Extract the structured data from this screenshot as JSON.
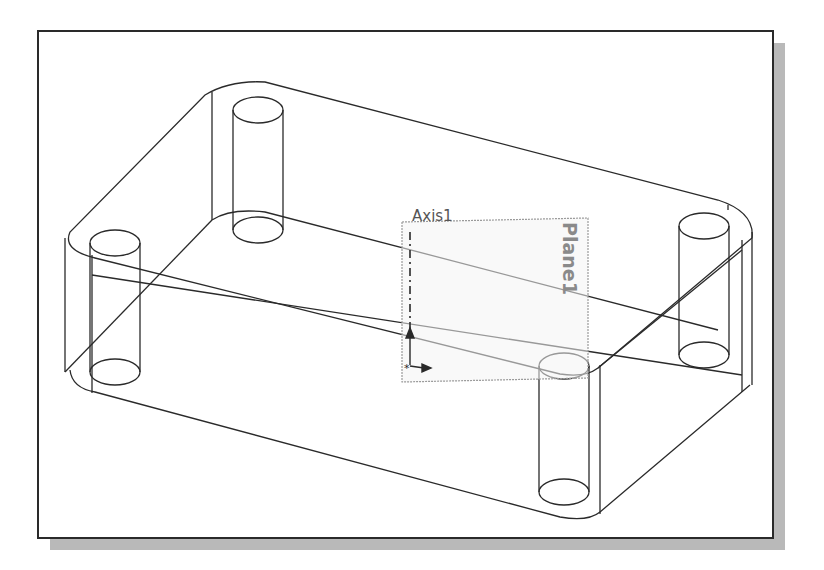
{
  "scene": {
    "description": "Isometric wireframe of a rounded rectangular box with four cylindrical bosses, a reference axis and a reference plane",
    "line_color": "#2a2a2a",
    "plane_color": "#9a9a9a",
    "frame_border_color": "#2a2a2a",
    "shadow_color": "#b9b9b9"
  },
  "labels": {
    "axis": "Axis1",
    "plane": "Plane1"
  },
  "features": {
    "bosses": [
      "back-left",
      "left",
      "front",
      "right"
    ],
    "reference_axis": "Axis1",
    "reference_plane": "Plane1"
  }
}
